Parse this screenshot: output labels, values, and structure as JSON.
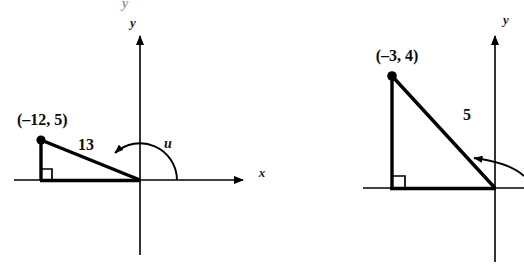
{
  "figure": {
    "background_color": "#ffffff",
    "ink_color": "#000000",
    "page_bleed_color": "#9a9a9a",
    "top_cut_off_glyph": "y"
  },
  "diagrams": [
    {
      "id": "left-diagram",
      "name": "angle-u-point-minus12-5",
      "axes": {
        "x_label": "x",
        "y_label": "y",
        "origin": {
          "x": 140,
          "y": 180
        }
      },
      "point": {
        "label": "(–12, 5)",
        "x_value": -12,
        "y_value": 5,
        "plot": {
          "x": 41,
          "y": 140
        }
      },
      "hypotenuse": {
        "length_label": "13",
        "length_value": 13
      },
      "angle": {
        "label": "u",
        "arc_direction": "counterclockwise-from-positive-x-axis"
      },
      "right_angle_marker": true
    },
    {
      "id": "right-diagram",
      "name": "angle-point-minus3-4",
      "axes": {
        "x_label": "",
        "y_label": "y",
        "origin": {
          "x": 495,
          "y": 188
        }
      },
      "point": {
        "label": "(–3, 4)",
        "x_value": -3,
        "y_value": 4,
        "plot": {
          "x": 420,
          "y": 76
        }
      },
      "hypotenuse": {
        "length_label": "5",
        "length_value": 5
      },
      "angle": {
        "label": "",
        "arc_direction": "counterclockwise-from-positive-x-axis"
      },
      "right_angle_marker": true
    }
  ]
}
